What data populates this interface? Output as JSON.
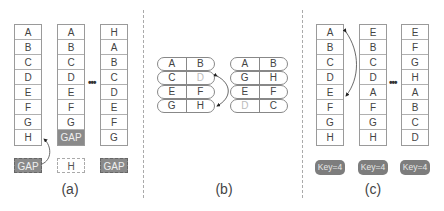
{
  "panel_a": {
    "caption": "(a)",
    "columns": [
      {
        "cells": [
          "A",
          "B",
          "C",
          "D",
          "E",
          "F",
          "G",
          "H"
        ],
        "gap_index": -1
      },
      {
        "cells": [
          "A",
          "B",
          "C",
          "D",
          "E",
          "F",
          "G",
          "GAP"
        ],
        "gap_index": 7
      },
      {
        "cells": [
          "H",
          "A",
          "B",
          "C",
          "D",
          "E",
          "F",
          "G"
        ],
        "gap_index": -1
      }
    ],
    "below": [
      "GAP",
      "H",
      "GAP"
    ],
    "ellipsis": "•••"
  },
  "panel_b": {
    "caption": "(b)",
    "left_group": [
      [
        "A",
        "B"
      ],
      [
        "C",
        "D"
      ],
      [
        "E",
        "F"
      ],
      [
        "G",
        "H"
      ]
    ],
    "right_group": [
      [
        "A",
        "B"
      ],
      [
        "G",
        "H"
      ],
      [
        "E",
        "F"
      ],
      [
        "D",
        "C"
      ]
    ]
  },
  "panel_c": {
    "caption": "(c)",
    "columns": [
      {
        "cells": [
          "A",
          "B",
          "C",
          "D",
          "E",
          "F",
          "G",
          "H"
        ]
      },
      {
        "cells": [
          "E",
          "B",
          "C",
          "D",
          "A",
          "F",
          "G",
          "H"
        ]
      },
      {
        "cells": [
          "E",
          "F",
          "G",
          "H",
          "A",
          "B",
          "C",
          "D"
        ]
      }
    ],
    "keys": [
      "Key=4",
      "Key=4",
      "Key=4"
    ],
    "ellipsis": "•••"
  }
}
